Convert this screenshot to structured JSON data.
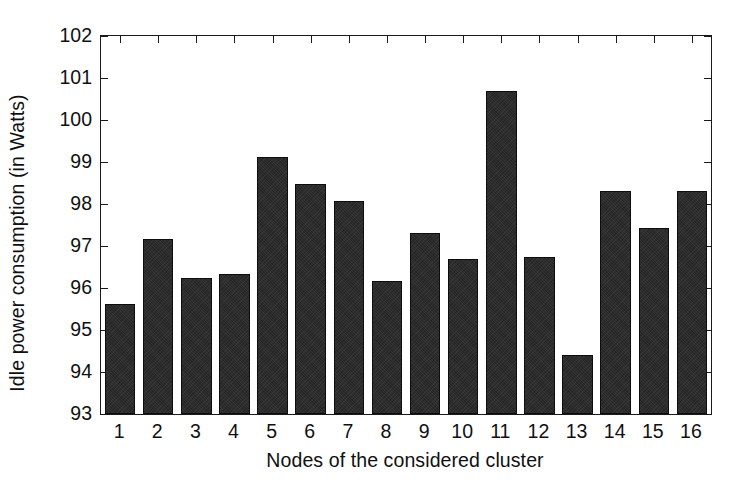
{
  "chart_data": {
    "type": "bar",
    "title": "",
    "xlabel": "Nodes of the considered cluster",
    "ylabel": "Idle power consumption (in Watts)",
    "categories": [
      "1",
      "2",
      "3",
      "4",
      "5",
      "6",
      "7",
      "8",
      "9",
      "10",
      "11",
      "12",
      "13",
      "14",
      "15",
      "16"
    ],
    "values": [
      95.62,
      97.17,
      96.25,
      96.33,
      99.13,
      98.48,
      98.08,
      96.17,
      97.32,
      96.7,
      100.68,
      96.73,
      94.4,
      98.32,
      97.43,
      98.32
    ],
    "ylim": [
      93,
      102
    ],
    "yticks": [
      "93",
      "94",
      "95",
      "96",
      "97",
      "98",
      "99",
      "100",
      "101",
      "102"
    ],
    "ytick_values": [
      93,
      94,
      95,
      96,
      97,
      98,
      99,
      100,
      101,
      102
    ],
    "xlim": [
      0.5,
      16.5
    ],
    "grid": false,
    "legend": null,
    "bar_color": "#262626",
    "axis_color": "#1a1a1a",
    "background_color": "#ffffff",
    "annotations": []
  }
}
